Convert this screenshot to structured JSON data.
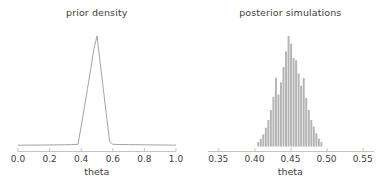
{
  "figure": {
    "width": 387,
    "height": 188,
    "background": "#ffffff",
    "line_color": "#999999",
    "bar_color": "#b5b5b5",
    "axis_color": "#bdbdbd",
    "text_color": "#3d3d3d"
  },
  "panels": [
    {
      "name": "prior-density",
      "title": "prior density",
      "xlabel": "theta"
    },
    {
      "name": "posterior-simulations",
      "title": "posterior simulations",
      "xlabel": "theta"
    }
  ],
  "chart_data": [
    {
      "type": "line",
      "title": "prior density",
      "xlabel": "theta",
      "ylabel": "",
      "xlim": [
        0.0,
        1.0
      ],
      "ylim": [
        0,
        1.0
      ],
      "grid": false,
      "legend": null,
      "xticks": [
        0.0,
        0.2,
        0.4,
        0.6,
        0.8,
        1.0
      ],
      "xticklabels": [
        "0.0",
        "0.2",
        "0.4",
        "0.6",
        "0.8",
        "1.0"
      ],
      "x": [
        0.0,
        0.05,
        0.1,
        0.15,
        0.2,
        0.25,
        0.3,
        0.34,
        0.38,
        0.4,
        0.42,
        0.44,
        0.46,
        0.48,
        0.5,
        0.52,
        0.54,
        0.56,
        0.58,
        0.6,
        0.64,
        0.7,
        0.76,
        0.82,
        0.88,
        0.94,
        1.0
      ],
      "y": [
        0.012,
        0.012,
        0.013,
        0.013,
        0.014,
        0.015,
        0.016,
        0.017,
        0.02,
        0.185,
        0.355,
        0.525,
        0.7,
        0.88,
        1.0,
        0.76,
        0.52,
        0.28,
        0.045,
        0.02,
        0.018,
        0.017,
        0.016,
        0.015,
        0.014,
        0.013,
        0.012
      ]
    },
    {
      "type": "bar",
      "title": "posterior simulations",
      "xlabel": "theta",
      "ylabel": "",
      "xlim": [
        0.335,
        0.565
      ],
      "ylim": [
        0,
        1.0
      ],
      "grid": false,
      "legend": null,
      "xticks": [
        0.35,
        0.4,
        0.45,
        0.5,
        0.55
      ],
      "xticklabels": [
        "0.35",
        "0.40",
        "0.45",
        "0.50",
        "0.55"
      ],
      "bin_width": 0.0035,
      "categories": [
        0.405,
        0.4085,
        0.412,
        0.4155,
        0.419,
        0.4225,
        0.426,
        0.4295,
        0.433,
        0.4365,
        0.44,
        0.4435,
        0.447,
        0.4505,
        0.454,
        0.4575,
        0.461,
        0.4645,
        0.468,
        0.4715,
        0.475,
        0.4785,
        0.482,
        0.4855,
        0.489,
        0.4925
      ],
      "values": [
        0.04,
        0.07,
        0.11,
        0.17,
        0.24,
        0.33,
        0.45,
        0.62,
        0.47,
        0.58,
        0.72,
        0.86,
        1.0,
        0.93,
        0.8,
        0.78,
        0.66,
        0.55,
        0.62,
        0.44,
        0.33,
        0.24,
        0.18,
        0.12,
        0.07,
        0.04
      ]
    }
  ]
}
